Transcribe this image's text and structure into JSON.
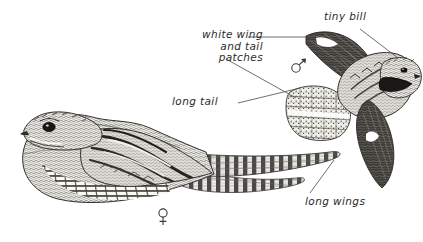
{
  "plate": {
    "title": "Nighthawk field guide plate",
    "background_color": "#ffffff",
    "ink_color": "#2b2b2b",
    "subjects": [
      {
        "id": "perched-bird",
        "name": "perched nighthawk, female",
        "sex_symbol": "♀",
        "pose": "perched, facing left, long barred tail extending right"
      },
      {
        "id": "flying-bird",
        "name": "flying nighthawk, male",
        "sex_symbol": "♂",
        "pose": "in flight, mouth open, long pointed wings, white wing patch"
      }
    ]
  },
  "annotations": [
    {
      "id": "tiny-bill",
      "text": "tiny bill",
      "points_to": "bill of flying bird"
    },
    {
      "id": "white-wing-patches",
      "line1": "white wing",
      "line2": "and tail",
      "line3": "patches",
      "text": "white wing and tail patches",
      "points_to": "white wing bar and white tail band of flying bird"
    },
    {
      "id": "long-tail",
      "text": "long tail",
      "points_to": "tail of flying bird"
    },
    {
      "id": "long-wings",
      "text": "long wings",
      "points_to": "wingtip of flying bird"
    }
  ],
  "symbols": {
    "male": "♂",
    "female": "♀"
  }
}
